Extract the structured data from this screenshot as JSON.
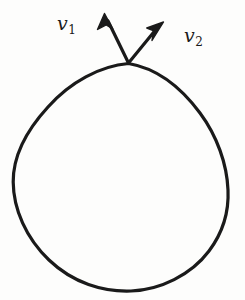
{
  "figure": {
    "background_color": "#fdfdfc",
    "ink_color": "#1a1a1a",
    "width": 245,
    "height": 300
  },
  "labels": {
    "v1": {
      "symbol": "v",
      "subscript": "1",
      "text": "v1"
    },
    "v2": {
      "symbol": "v",
      "subscript": "2",
      "text": "v2"
    }
  },
  "geometry": {
    "curve": {
      "type": "closed-blob",
      "apex": [
        130,
        63
      ],
      "bottom": [
        131,
        291
      ],
      "left_extreme": [
        13,
        181
      ],
      "right_extreme": [
        228,
        190
      ],
      "stroke_width": 3.2
    },
    "vectors": [
      {
        "name": "v1",
        "origin": [
          128,
          63
        ],
        "tip": [
          105,
          14
        ],
        "stroke_width": 3.2,
        "arrowhead": "solid-barb"
      },
      {
        "name": "v2",
        "origin": [
          128,
          63
        ],
        "tip": [
          163,
          22
        ],
        "stroke_width": 3.2,
        "arrowhead": "solid-barb"
      }
    ]
  }
}
